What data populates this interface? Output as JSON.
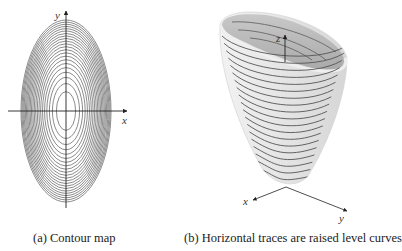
{
  "figure": {
    "panel_a": {
      "caption": "(a) Contour map",
      "axes": {
        "x_label": "x",
        "y_label": "y"
      },
      "contour_count": 22
    },
    "panel_b": {
      "caption": "(b) Horizontal traces are raised level curves",
      "axes": {
        "x_label": "x",
        "y_label": "y",
        "z_label": "z"
      },
      "trace_count": 20
    }
  },
  "colors": {
    "contour_line": "#555555",
    "axis": "#222222",
    "surface_outer": "#e4e4e4",
    "surface_inner": "#b9b9b9",
    "trace_line": "#555555"
  }
}
